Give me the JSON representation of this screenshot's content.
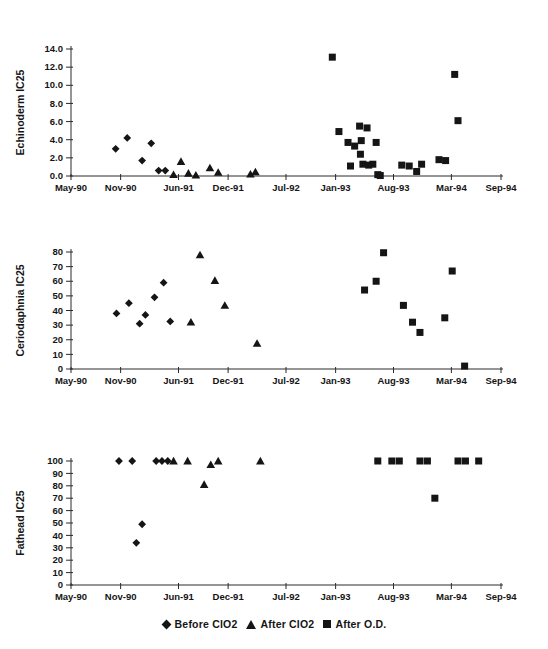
{
  "page": {
    "background": "#ffffff",
    "ink": "#151515",
    "axis_color": "#2a2a2a"
  },
  "legend": {
    "items": [
      {
        "marker": "diamond",
        "label": "Before ClO2"
      },
      {
        "marker": "triangle",
        "label": "After ClO2"
      },
      {
        "marker": "square",
        "label": "After O.D."
      }
    ]
  },
  "chart_data": [
    {
      "type": "scatter",
      "name": "echinoderm",
      "ylabel": "Echinoderm IC25",
      "ylim": [
        0,
        14
      ],
      "yticks": [
        0,
        2,
        4,
        6,
        8,
        10,
        12,
        14
      ],
      "ytick_labels": [
        "0.0",
        "2.0",
        "4.0",
        "6.0",
        "8.0",
        "10.0",
        "12.0",
        "14.0"
      ],
      "xlim": [
        0,
        52
      ],
      "x_unit": "months since May-1990",
      "xticks": [
        0,
        6,
        13,
        19,
        26,
        32,
        39,
        46,
        52
      ],
      "xtick_labels": [
        "May-90",
        "Nov-90",
        "Jun-91",
        "Dec-91",
        "Jul-92",
        "Jan-93",
        "Aug-93",
        "Mar-94",
        "Sep-94"
      ],
      "grid": false,
      "series": [
        {
          "name": "Before ClO2",
          "marker": "diamond",
          "points": [
            [
              5.4,
              3.0
            ],
            [
              6.8,
              4.2
            ],
            [
              8.6,
              1.7
            ],
            [
              9.7,
              3.6
            ],
            [
              10.6,
              0.6
            ],
            [
              11.4,
              0.6
            ]
          ]
        },
        {
          "name": "After ClO2",
          "marker": "triangle",
          "points": [
            [
              12.4,
              0.15
            ],
            [
              13.3,
              1.6
            ],
            [
              14.2,
              0.3
            ],
            [
              15.1,
              0.1
            ],
            [
              16.8,
              0.9
            ],
            [
              17.8,
              0.4
            ],
            [
              21.7,
              0.2
            ],
            [
              22.3,
              0.45
            ]
          ]
        },
        {
          "name": "After O.D.",
          "marker": "square",
          "points": [
            [
              31.6,
              13.1
            ],
            [
              32.4,
              4.9
            ],
            [
              33.5,
              3.7
            ],
            [
              33.8,
              1.1
            ],
            [
              34.3,
              3.3
            ],
            [
              34.9,
              5.5
            ],
            [
              35.0,
              2.4
            ],
            [
              35.1,
              3.9
            ],
            [
              35.3,
              1.3
            ],
            [
              35.8,
              5.3
            ],
            [
              36.0,
              1.2
            ],
            [
              36.5,
              1.3
            ],
            [
              36.9,
              3.7
            ],
            [
              37.1,
              0.15
            ],
            [
              37.4,
              0.05
            ],
            [
              40.0,
              1.2
            ],
            [
              40.9,
              1.1
            ],
            [
              41.8,
              0.5
            ],
            [
              42.4,
              1.3
            ],
            [
              44.5,
              1.8
            ],
            [
              45.3,
              1.7
            ],
            [
              46.4,
              11.2
            ],
            [
              46.8,
              6.1
            ]
          ]
        }
      ]
    },
    {
      "type": "scatter",
      "name": "ceriodaphnia",
      "ylabel": "Ceriodaphnia IC25",
      "ylim": [
        0,
        80
      ],
      "yticks": [
        0,
        10,
        20,
        30,
        40,
        50,
        60,
        70,
        80
      ],
      "ytick_labels": [
        "0",
        "10",
        "20",
        "30",
        "40",
        "50",
        "60",
        "70",
        "80"
      ],
      "xlim": [
        0,
        52
      ],
      "x_unit": "months since May-1990",
      "xticks": [
        0,
        6,
        13,
        19,
        26,
        32,
        39,
        46,
        52
      ],
      "xtick_labels": [
        "May-90",
        "Nov-90",
        "Jun-91",
        "Dec-91",
        "Jul-92",
        "Jan-93",
        "Aug-93",
        "Mar-94",
        "Sep-94"
      ],
      "grid": false,
      "series": [
        {
          "name": "Before ClO2",
          "marker": "diamond",
          "points": [
            [
              5.5,
              38
            ],
            [
              7.0,
              45
            ],
            [
              8.3,
              31
            ],
            [
              9.0,
              37
            ],
            [
              10.1,
              49
            ],
            [
              11.2,
              59
            ],
            [
              12.0,
              32.5
            ]
          ]
        },
        {
          "name": "After ClO2",
          "marker": "triangle",
          "points": [
            [
              14.5,
              32
            ],
            [
              15.6,
              78
            ],
            [
              17.4,
              60.5
            ],
            [
              18.6,
              43.5
            ],
            [
              22.5,
              17.5
            ]
          ]
        },
        {
          "name": "After O.D.",
          "marker": "square",
          "points": [
            [
              35.5,
              54
            ],
            [
              36.9,
              60
            ],
            [
              37.8,
              79.5
            ],
            [
              40.2,
              43.5
            ],
            [
              41.3,
              32
            ],
            [
              42.2,
              25
            ],
            [
              45.2,
              35
            ],
            [
              46.1,
              67
            ],
            [
              47.6,
              2
            ]
          ]
        }
      ]
    },
    {
      "type": "scatter",
      "name": "fathead",
      "ylabel": "Fathead IC25",
      "ylim": [
        0,
        100
      ],
      "yticks": [
        0,
        10,
        20,
        30,
        40,
        50,
        60,
        70,
        80,
        90,
        100
      ],
      "ytick_labels": [
        "0",
        "10",
        "20",
        "30",
        "40",
        "50",
        "60",
        "70",
        "80",
        "90",
        "100"
      ],
      "xlim": [
        0,
        52
      ],
      "x_unit": "months since May-1990",
      "xticks": [
        0,
        6,
        13,
        19,
        26,
        32,
        39,
        46,
        52
      ],
      "xtick_labels": [
        "May-90",
        "Nov-90",
        "Jun-91",
        "Dec-91",
        "Jul-92",
        "Jan-93",
        "Aug-93",
        "Mar-94",
        "Sep-94"
      ],
      "grid": false,
      "series": [
        {
          "name": "Before ClO2",
          "marker": "diamond",
          "points": [
            [
              5.8,
              100
            ],
            [
              7.4,
              100
            ],
            [
              7.9,
              34
            ],
            [
              8.6,
              49
            ],
            [
              10.3,
              100
            ],
            [
              11.0,
              100
            ],
            [
              11.7,
              100
            ]
          ]
        },
        {
          "name": "After ClO2",
          "marker": "triangle",
          "points": [
            [
              12.4,
              100
            ],
            [
              14.1,
              100
            ],
            [
              16.1,
              81
            ],
            [
              16.9,
              97
            ],
            [
              17.8,
              100
            ],
            [
              22.9,
              100
            ]
          ]
        },
        {
          "name": "After O.D.",
          "marker": "square",
          "points": [
            [
              37.1,
              100
            ],
            [
              38.8,
              100
            ],
            [
              39.7,
              100
            ],
            [
              42.2,
              100
            ],
            [
              43.1,
              100
            ],
            [
              44.0,
              70
            ],
            [
              46.8,
              100
            ],
            [
              47.7,
              100
            ],
            [
              49.3,
              100
            ]
          ]
        }
      ]
    }
  ]
}
